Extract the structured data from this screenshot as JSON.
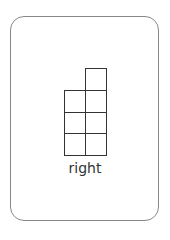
{
  "card": {
    "label": "right",
    "border_color": "#888888"
  },
  "grid": {
    "columns": 2,
    "column_heights": [
      3,
      4
    ],
    "cells": [
      {
        "col": 1,
        "row": 0
      },
      {
        "col": 0,
        "row": 1
      },
      {
        "col": 1,
        "row": 1
      },
      {
        "col": 0,
        "row": 2
      },
      {
        "col": 1,
        "row": 2
      },
      {
        "col": 0,
        "row": 3
      },
      {
        "col": 1,
        "row": 3
      }
    ]
  }
}
